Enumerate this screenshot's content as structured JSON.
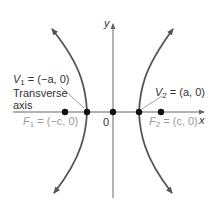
{
  "diagram": {
    "axes": {
      "x_label": "x",
      "y_label": "y",
      "origin_label": "0"
    },
    "labels": {
      "v1": "V₁ = (−a, 0)",
      "v1_main": "V",
      "v1_sub": "1",
      "v1_rest": " = (−a, 0)",
      "v2_main": "V",
      "v2_sub": "2",
      "v2_rest": " = (a, 0)",
      "transverse_line1": "Transverse",
      "transverse_line2": "axis",
      "f1_main": "F",
      "f1_sub": "1",
      "f1_rest": " = (−c, 0)",
      "f2_main": "F",
      "f2_sub": "2",
      "f2_rest": " = (c, 0)"
    },
    "points": [
      {
        "name": "F1",
        "coord": "(-c, 0)"
      },
      {
        "name": "V1",
        "coord": "(-a, 0)"
      },
      {
        "name": "O",
        "coord": "(0, 0)"
      },
      {
        "name": "V2",
        "coord": "(a, 0)"
      },
      {
        "name": "F2",
        "coord": "(c, 0)"
      }
    ],
    "colors": {
      "curve": "#555555",
      "axis": "#555555",
      "point": "#111111",
      "focus_label": "#9a9a9a",
      "text": "#333333"
    }
  }
}
